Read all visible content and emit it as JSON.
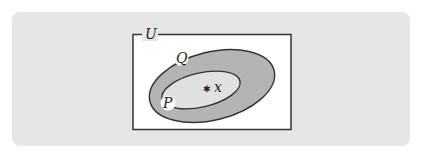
{
  "diagram": {
    "type": "venn",
    "universe": {
      "label": "U"
    },
    "sets": [
      {
        "id": "Q",
        "label": "Q",
        "contains": [
          "P"
        ]
      },
      {
        "id": "P",
        "label": "P",
        "contains": [
          "x"
        ]
      }
    ],
    "point": {
      "label": "x",
      "marker": "✱",
      "in_set": "P"
    },
    "colors": {
      "panel_background": "#e6e6e6",
      "universe_fill": "#ffffff",
      "outline": "#333333",
      "outer_set_fill": "#b4b4b4",
      "inner_set_fill": "#e0e0e0",
      "label_background": "#ffffff"
    }
  }
}
